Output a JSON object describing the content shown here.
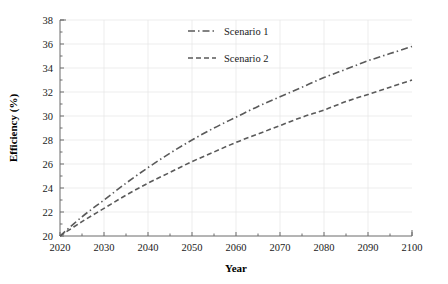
{
  "chart_data": {
    "type": "line",
    "title": "",
    "xlabel": "Year",
    "ylabel": "Efficiency (%)",
    "xlim": [
      2020,
      2100
    ],
    "ylim": [
      20,
      38
    ],
    "xticks": [
      2020,
      2030,
      2040,
      2050,
      2060,
      2070,
      2080,
      2090,
      2100
    ],
    "yticks": [
      20,
      22,
      24,
      26,
      28,
      30,
      32,
      34,
      36,
      38
    ],
    "grid": true,
    "legend_position": "top-center",
    "x": [
      2020,
      2025,
      2030,
      2035,
      2040,
      2045,
      2050,
      2055,
      2060,
      2065,
      2070,
      2075,
      2080,
      2085,
      2090,
      2095,
      2100
    ],
    "series": [
      {
        "name": "Scenario 1",
        "style": "dash-dot",
        "color": "#5a5a5a",
        "values": [
          20.0,
          21.6,
          23.0,
          24.4,
          25.7,
          26.9,
          28.0,
          29.0,
          29.9,
          30.8,
          31.6,
          32.4,
          33.2,
          33.9,
          34.6,
          35.2,
          35.8
        ]
      },
      {
        "name": "Scenario 2",
        "style": "dashed",
        "color": "#5a5a5a",
        "values": [
          20.0,
          21.2,
          22.3,
          23.4,
          24.4,
          25.3,
          26.2,
          27.0,
          27.8,
          28.5,
          29.2,
          29.9,
          30.5,
          31.2,
          31.8,
          32.4,
          33.0
        ]
      }
    ]
  },
  "legend": {
    "entries": [
      {
        "label": "Scenario 1"
      },
      {
        "label": "Scenario 2"
      }
    ]
  },
  "axes": {
    "x_title": "Year",
    "y_title": "Efficiency (%)"
  }
}
